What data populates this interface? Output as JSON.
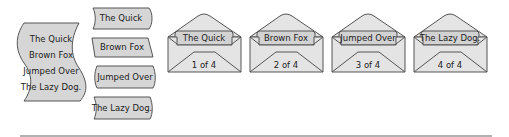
{
  "source_document": {
    "lines": [
      "The Quick",
      "Brown Fox",
      "Jumped Over",
      "The Lazy Dog."
    ]
  },
  "split_items": [
    {
      "label": "The Quick"
    },
    {
      "label": "Brown Fox"
    },
    {
      "label": "Jumped Over"
    },
    {
      "label": "The Lazy Dog."
    }
  ],
  "envelopes": [
    {
      "label": "The Quick",
      "counter": "1 of 4"
    },
    {
      "label": "Brown Fox",
      "counter": "2 of 4"
    },
    {
      "label": "Jumped Over",
      "counter": "3 of 4"
    },
    {
      "label": "The Lazy Dog.",
      "counter": "4 of 4"
    }
  ],
  "colors": {
    "fill": "#d6d6d6",
    "stroke": "#555555",
    "divider": "#999999"
  }
}
